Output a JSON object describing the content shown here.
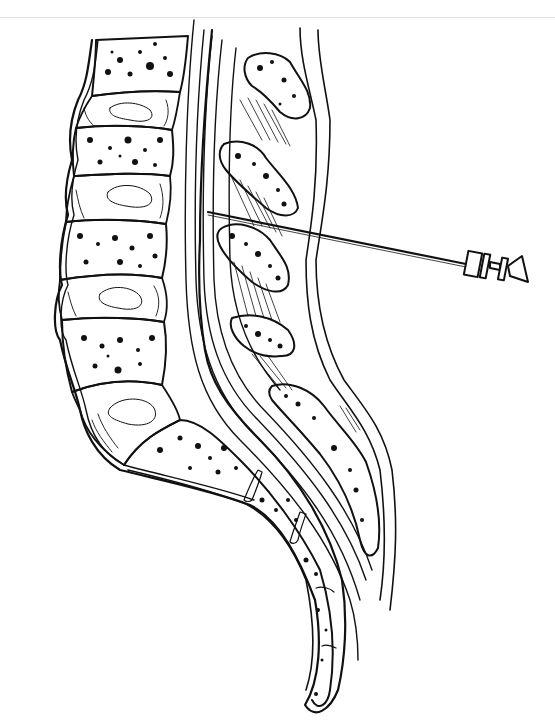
{
  "figure": {
    "style": "black ink line art on white",
    "colors": {
      "ink": "#111111",
      "background": "#ffffff",
      "top_rule": "#e2e2e2"
    },
    "structures": [
      "lumbar-vertebral-bodies",
      "intervertebral-discs",
      "spinal-canal",
      "spinous-processes",
      "interspinous-ligaments",
      "sacrum",
      "coccyx",
      "spinal-needle"
    ]
  }
}
